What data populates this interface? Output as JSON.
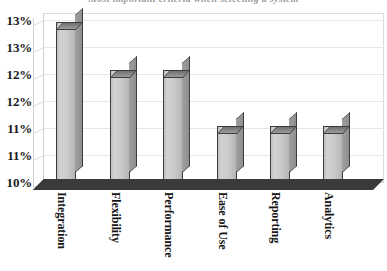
{
  "chart_data": {
    "type": "bar",
    "title": "Most important criteria when selecting a system",
    "categories": [
      "Integration",
      "Flexibility",
      "Performance",
      "Ease of Use",
      "Reporting",
      "Analytics"
    ],
    "values": [
      13.0,
      12.1,
      12.1,
      11.0,
      11.0,
      11.0
    ],
    "value_labels": [
      "13%",
      "12%",
      "12%",
      "11%",
      "11%",
      "11%"
    ],
    "xlabel": "",
    "ylabel": "",
    "ylim": [
      10.0,
      13.0
    ],
    "ytick_values": [
      13.0,
      12.5,
      12.0,
      11.5,
      11.0,
      10.5,
      10.0
    ],
    "ytick_labels": [
      "13%",
      "13%",
      "12%",
      "12%",
      "11%",
      "11%",
      "10%"
    ],
    "grid": true,
    "legend": "none",
    "style": "3d-bar",
    "colors": {
      "bar_face": "#cbcbcb",
      "bar_side": "#9a9a9a",
      "bar_top": "#8a8a8a",
      "bar_outline": "#3d3d3d",
      "floor": "#3a3a3a",
      "gridline": "#e6e6e6",
      "text": "#151515",
      "background": "#ffffff"
    }
  },
  "axis": {
    "ticks": [
      {
        "label": "13%",
        "y": 20
      },
      {
        "label": "13%",
        "y": 47
      },
      {
        "label": "12%",
        "y": 74
      },
      {
        "label": "12%",
        "y": 101
      },
      {
        "label": "11%",
        "y": 128
      },
      {
        "label": "11%",
        "y": 155
      },
      {
        "label": "10%",
        "y": 182
      }
    ]
  },
  "bars": [
    {
      "label": "Integration",
      "x": 56,
      "top": 22,
      "value": 13.0
    },
    {
      "label": "Flexibility",
      "x": 110,
      "top": 70,
      "value": 12.1
    },
    {
      "label": "Performance",
      "x": 163,
      "top": 70,
      "value": 12.1
    },
    {
      "label": "Ease of Use",
      "x": 217,
      "top": 126,
      "value": 11.0
    },
    {
      "label": "Reporting",
      "x": 270,
      "top": 126,
      "value": 11.0
    },
    {
      "label": "Analytics",
      "x": 323,
      "top": 126,
      "value": 11.0
    }
  ]
}
